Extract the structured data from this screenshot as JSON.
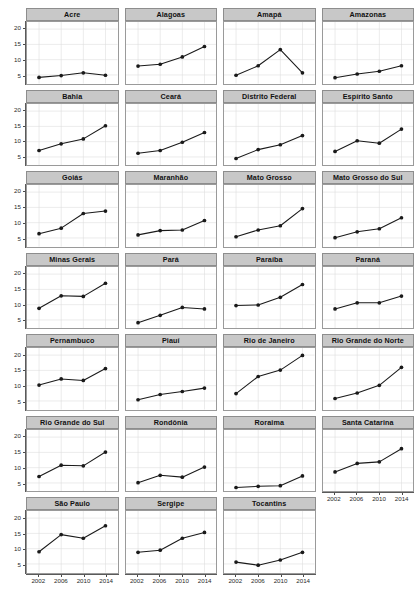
{
  "chart_data": {
    "type": "line",
    "title": "",
    "subtitle": "",
    "xlabel": "",
    "ylabel": "",
    "x": [
      2002,
      2006,
      2010,
      2014
    ],
    "xtick_labels": [
      "2002",
      "2006",
      "2010",
      "2014"
    ],
    "ytick_labels": [
      "5",
      "10",
      "15",
      "20"
    ],
    "ytick_values": [
      5,
      10,
      15,
      20
    ],
    "xlim": [
      2000,
      2016
    ],
    "ylim": [
      2.5,
      22
    ],
    "grid": true,
    "legend": "none",
    "facet_layout": {
      "rows": 7,
      "cols": 4,
      "total_panels": 27
    },
    "marker": "filled-circle",
    "line_color": "#1a1a1a",
    "marker_color": "#1a1a1a",
    "grid_color": "#dddddd",
    "strip_fill": "#c8c8c8",
    "strip_border": "#8d8d8d",
    "panel_border": "#9a9a9a",
    "panel_fill": "#ffffff",
    "series": [
      {
        "name": "Acre",
        "values": [
          4.2,
          4.8,
          5.7,
          4.9
        ]
      },
      {
        "name": "Alagoas",
        "values": [
          7.9,
          8.5,
          10.9,
          14.3
        ]
      },
      {
        "name": "Amapá",
        "values": [
          4.9,
          8.0,
          13.3,
          5.7
        ]
      },
      {
        "name": "Amazonas",
        "values": [
          4.1,
          5.3,
          6.2,
          8.0
        ]
      },
      {
        "name": "Bahia",
        "values": [
          7.1,
          9.3,
          10.9,
          15.2
        ]
      },
      {
        "name": "Ceará",
        "values": [
          6.2,
          7.1,
          9.8,
          13.0
        ]
      },
      {
        "name": "Distrito Federal",
        "values": [
          4.5,
          7.4,
          9.0,
          12.0
        ]
      },
      {
        "name": "Espírito Santo",
        "values": [
          6.8,
          10.3,
          9.5,
          14.1
        ]
      },
      {
        "name": "Goiás",
        "values": [
          6.4,
          8.2,
          13.0,
          13.8
        ]
      },
      {
        "name": "Maranhão",
        "values": [
          6.0,
          7.4,
          7.6,
          10.7
        ]
      },
      {
        "name": "Mato Grosso",
        "values": [
          5.4,
          7.6,
          9.0,
          14.6
        ]
      },
      {
        "name": "Mato Grosso do Sul",
        "values": [
          5.1,
          7.0,
          8.0,
          11.6
        ]
      },
      {
        "name": "Minas Gerais",
        "values": [
          8.8,
          12.9,
          12.7,
          17.0
        ]
      },
      {
        "name": "Pará",
        "values": [
          4.1,
          6.5,
          9.1,
          8.6
        ]
      },
      {
        "name": "Paraíba",
        "values": [
          9.7,
          9.9,
          12.4,
          16.6
        ]
      },
      {
        "name": "Paraná",
        "values": [
          8.6,
          10.6,
          10.6,
          12.8
        ]
      },
      {
        "name": "Pernambuco",
        "values": [
          10.2,
          12.2,
          11.7,
          15.6
        ]
      },
      {
        "name": "Piauí",
        "values": [
          5.4,
          7.1,
          8.1,
          9.2
        ]
      },
      {
        "name": "Rio de Janeiro",
        "values": [
          7.4,
          13.0,
          15.1,
          19.9
        ]
      },
      {
        "name": "Rio Grande do Norte",
        "values": [
          5.8,
          7.6,
          10.1,
          16.0
        ]
      },
      {
        "name": "Rio Grande do Sul",
        "values": [
          7.1,
          10.8,
          10.6,
          15.1
        ]
      },
      {
        "name": "Rondônia",
        "values": [
          5.1,
          7.5,
          6.9,
          10.2
        ]
      },
      {
        "name": "Roraima",
        "values": [
          3.5,
          3.9,
          4.1,
          7.3
        ]
      },
      {
        "name": "Santa Catarina",
        "values": [
          8.6,
          11.4,
          11.9,
          16.2
        ]
      },
      {
        "name": "São Paulo",
        "values": [
          9.0,
          14.6,
          13.4,
          17.5
        ]
      },
      {
        "name": "Sergipe",
        "values": [
          8.8,
          9.5,
          13.4,
          15.3
        ]
      },
      {
        "name": "Tocantins",
        "values": [
          5.6,
          4.6,
          6.3,
          8.8
        ]
      }
    ]
  },
  "axes": {
    "y_axis_label_0": "5",
    "y_axis_label_1": "10",
    "y_axis_label_2": "15",
    "y_axis_label_3": "20",
    "x_axis_label_0": "2002",
    "x_axis_label_1": "2006",
    "x_axis_label_2": "2010",
    "x_axis_label_3": "2014"
  }
}
